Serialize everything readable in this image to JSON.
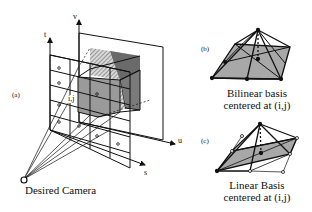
{
  "panel_a": {
    "label": "(a)",
    "axes": {
      "t": "t",
      "v": "v",
      "u": "u",
      "s": "s"
    },
    "cell_label": "i,j",
    "camera_label": "Desired Camera"
  },
  "panel_b": {
    "label": "(b)",
    "caption_line1": "Bilinear basis",
    "caption_line2": "centered at (i,j)"
  },
  "panel_c": {
    "label": "(c)",
    "caption_line1": "Linear Basis",
    "caption_line2": "centered at (i,j)"
  },
  "colors": {
    "line": "#111111",
    "gray_face": "#9a9a9a",
    "dark_face": "#6a6a6a",
    "hatch": "#555555"
  }
}
